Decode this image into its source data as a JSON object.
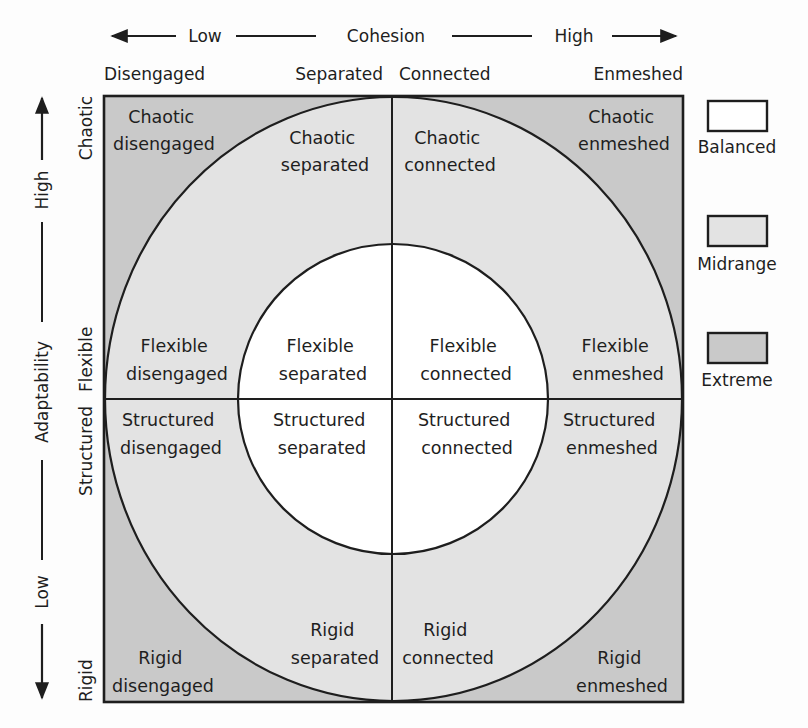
{
  "diagram": {
    "type": "circumplex-model",
    "colors": {
      "balanced": "#ffffff",
      "midrange": "#e3e3e3",
      "extreme": "#c9c9c9",
      "stroke": "#1e1e1e",
      "background": "#fdfdfd"
    },
    "top_axis": {
      "low": "Low",
      "title": "Cohesion",
      "high": "High",
      "levels": [
        "Disengaged",
        "Separated",
        "Connected",
        "Enmeshed"
      ]
    },
    "left_axis": {
      "low": "Low",
      "title": "Adaptability",
      "high": "High",
      "levels": [
        "Chaotic",
        "Flexible",
        "Structured",
        "Rigid"
      ]
    },
    "legend": [
      {
        "label": "Balanced",
        "color": "#ffffff"
      },
      {
        "label": "Midrange",
        "color": "#e3e3e3"
      },
      {
        "label": "Extreme",
        "color": "#c9c9c9"
      }
    ],
    "cells": {
      "chaotic_disengaged": [
        "Chaotic",
        "disengaged"
      ],
      "chaotic_separated": [
        "Chaotic",
        "separated"
      ],
      "chaotic_connected": [
        "Chaotic",
        "connected"
      ],
      "chaotic_enmeshed": [
        "Chaotic",
        "enmeshed"
      ],
      "flexible_disengaged": [
        "Flexible",
        "disengaged"
      ],
      "flexible_separated": [
        "Flexible",
        "separated"
      ],
      "flexible_connected": [
        "Flexible",
        "connected"
      ],
      "flexible_enmeshed": [
        "Flexible",
        "enmeshed"
      ],
      "structured_disengaged": [
        "Structured",
        "disengaged"
      ],
      "structured_separated": [
        "Structured",
        "separated"
      ],
      "structured_connected": [
        "Structured",
        "connected"
      ],
      "structured_enmeshed": [
        "Structured",
        "enmeshed"
      ],
      "rigid_disengaged": [
        "Rigid",
        "disengaged"
      ],
      "rigid_separated": [
        "Rigid",
        "separated"
      ],
      "rigid_connected": [
        "Rigid",
        "connected"
      ],
      "rigid_enmeshed": [
        "Rigid",
        "enmeshed"
      ]
    }
  }
}
